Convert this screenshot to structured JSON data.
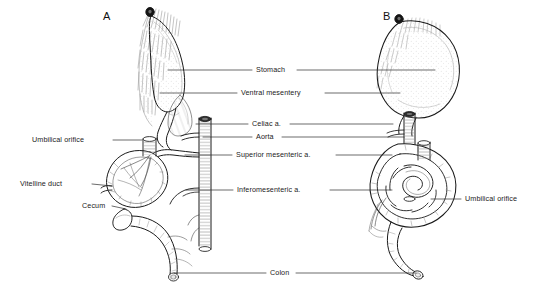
{
  "figure": {
    "domain": "anatomical-line-drawing",
    "background_color": "#ffffff",
    "ink_color": "#1a1a1a"
  },
  "panels": [
    {
      "id": "A",
      "label": "A"
    },
    {
      "id": "B",
      "label": "B"
    }
  ],
  "labels": {
    "stomach": "Stomach",
    "ventral_mesentery": "Ventral mesentery",
    "celiac": "Celiac a.",
    "aorta": "Aorta",
    "superior_mesenteric": "Superior mesenteric a.",
    "inferomesenteric": "Inferomesenteric a.",
    "umbilical_orifice_left": "Umbilical orifice",
    "umbilical_orifice_right": "Umbilical orifice",
    "vitelline_duct": "Vitelline duct",
    "cecum": "Cecum",
    "colon": "Colon"
  }
}
